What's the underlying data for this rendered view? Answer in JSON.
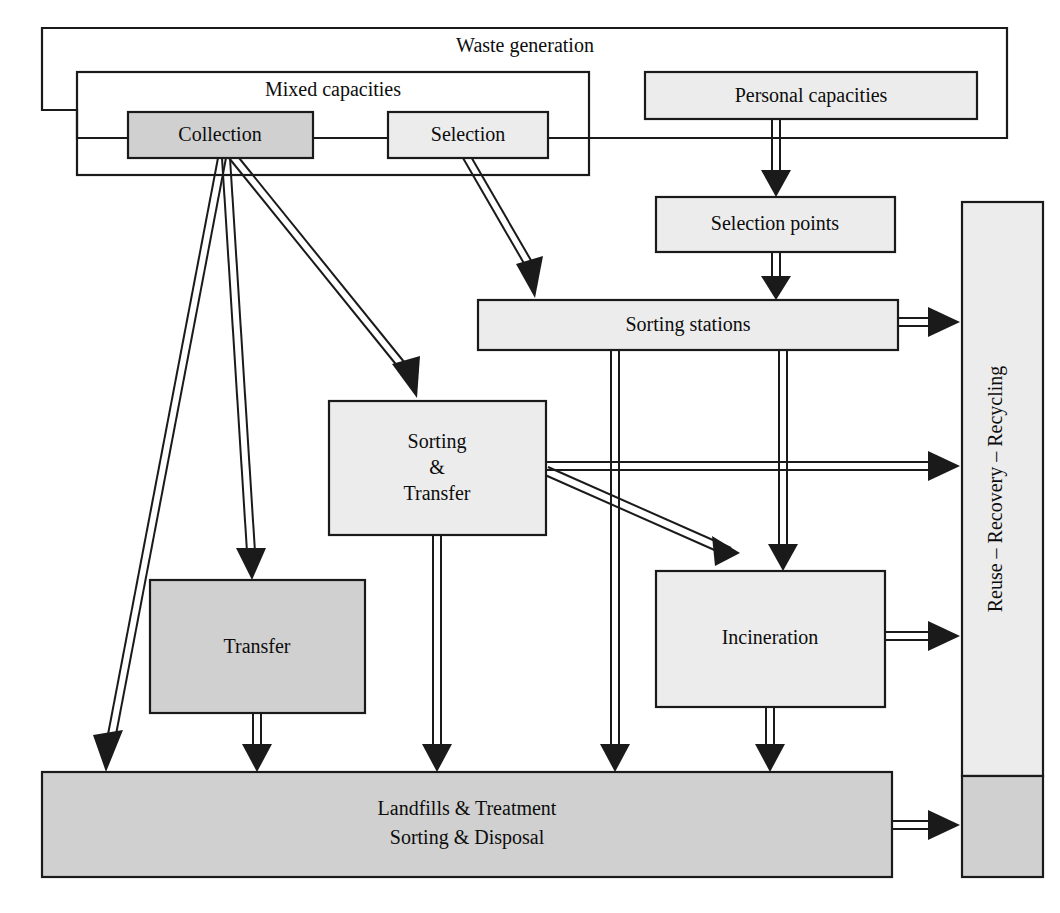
{
  "diagram": {
    "title": "Waste generation",
    "type": "flowchart",
    "background": "#ffffff",
    "stroke_color": "#1a1a1a",
    "fill_light": "#ececec",
    "fill_medium": "#d0d0d0",
    "groups": [
      {
        "id": "waste-generation",
        "label": "Waste generation"
      },
      {
        "id": "mixed-capacities",
        "label": "Mixed capacities"
      }
    ],
    "nodes": [
      {
        "id": "collection",
        "label": "Collection",
        "shade": "medium"
      },
      {
        "id": "selection",
        "label": "Selection",
        "shade": "light"
      },
      {
        "id": "personal-capacities",
        "label": "Personal capacities",
        "shade": "light"
      },
      {
        "id": "selection-points",
        "label": "Selection points",
        "shade": "light"
      },
      {
        "id": "sorting-stations",
        "label": "Sorting stations",
        "shade": "light"
      },
      {
        "id": "sorting-transfer",
        "label": "Sorting\n&\nTransfer",
        "shade": "light"
      },
      {
        "id": "transfer",
        "label": "Transfer",
        "shade": "medium"
      },
      {
        "id": "incineration",
        "label": "Incineration",
        "shade": "light"
      },
      {
        "id": "landfills",
        "label": "Landfills & Treatment\nSorting & Disposal",
        "shade": "medium"
      },
      {
        "id": "recovery-bar",
        "label": "Reuse – Recovery – Recycling",
        "shade": "light"
      }
    ],
    "node_labels": {
      "collection": "Collection",
      "selection": "Selection",
      "personal_capacities": "Personal capacities",
      "selection_points": "Selection points",
      "sorting_stations": "Sorting stations",
      "sorting_transfer_line1": "Sorting",
      "sorting_transfer_line2": "&",
      "sorting_transfer_line3": "Transfer",
      "transfer": "Transfer",
      "incineration": "Incineration",
      "landfills_line1": "Landfills & Treatment",
      "landfills_line2": "Sorting & Disposal",
      "recovery_bar": "Reuse – Recovery – Recycling"
    },
    "edges": [
      {
        "from": "collection",
        "to": "landfills"
      },
      {
        "from": "collection",
        "to": "transfer"
      },
      {
        "from": "collection",
        "to": "sorting-transfer"
      },
      {
        "from": "selection",
        "to": "sorting-stations"
      },
      {
        "from": "personal-capacities",
        "to": "selection-points"
      },
      {
        "from": "selection-points",
        "to": "sorting-stations"
      },
      {
        "from": "sorting-stations",
        "to": "recovery-bar"
      },
      {
        "from": "sorting-stations",
        "to": "landfills"
      },
      {
        "from": "sorting-stations",
        "to": "incineration"
      },
      {
        "from": "sorting-transfer",
        "to": "recovery-bar"
      },
      {
        "from": "sorting-transfer",
        "to": "incineration"
      },
      {
        "from": "sorting-transfer",
        "to": "landfills"
      },
      {
        "from": "transfer",
        "to": "landfills"
      },
      {
        "from": "incineration",
        "to": "recovery-bar"
      },
      {
        "from": "incineration",
        "to": "landfills"
      },
      {
        "from": "landfills",
        "to": "recovery-bar"
      }
    ]
  }
}
